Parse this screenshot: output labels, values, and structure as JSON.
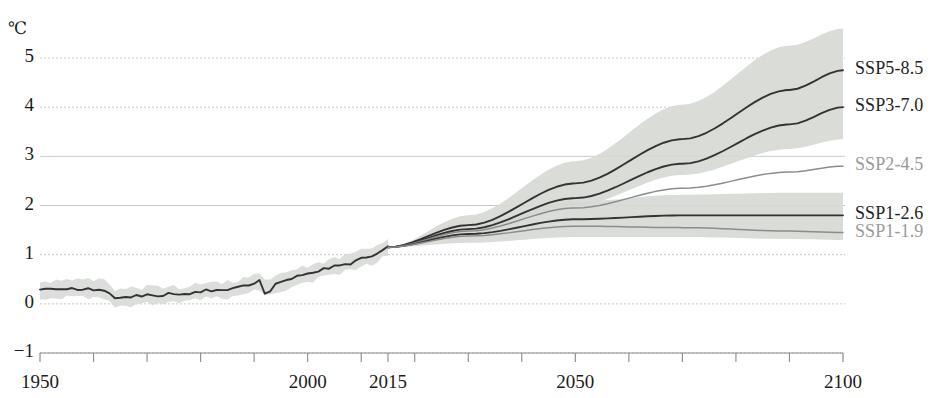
{
  "axes": {
    "unit_label": "℃",
    "y_ticks": [
      "5",
      "4",
      "3",
      "2",
      "1",
      "0",
      "−1"
    ],
    "y_tick_values": [
      5,
      4,
      3,
      2,
      1,
      0,
      -1
    ],
    "x_ticks": [
      "1950",
      "2000",
      "2015",
      "2050",
      "2100"
    ],
    "x_tick_values": [
      1950,
      2000,
      2015,
      2050,
      2100
    ],
    "x_minor_step": 10,
    "grid": "horizontal-dotted"
  },
  "legend": [
    {
      "label": "SSP5-8.5",
      "tone": "dark"
    },
    {
      "label": "SSP3-7.0",
      "tone": "dark"
    },
    {
      "label": "SSP2-4.5",
      "tone": "mid"
    },
    {
      "label": "SSP1-2.6",
      "tone": "dark"
    },
    {
      "label": "SSP1-1.9",
      "tone": "mid"
    }
  ],
  "colors": {
    "line_dark": "#333333",
    "line_mid": "#8c8c8c",
    "band_fill": "#d5d8d3",
    "grid": "#c9c9c9",
    "axis": "#8a8a8a",
    "text": "#1c1c1c"
  },
  "chart_data": {
    "type": "line",
    "title": "",
    "subtitle": "",
    "xlabel": "",
    "ylabel": "℃",
    "xlim": [
      1950,
      2100
    ],
    "ylim": [
      -1,
      5
    ],
    "grid": true,
    "legend_position": "right-inline",
    "series": [
      {
        "name": "historical",
        "label": "Historical observations",
        "tone": "dark",
        "has_band": true,
        "x": [
          1950,
          1952,
          1954,
          1956,
          1958,
          1960,
          1962,
          1964,
          1966,
          1968,
          1970,
          1972,
          1974,
          1976,
          1978,
          1980,
          1982,
          1984,
          1986,
          1988,
          1990,
          1991,
          1992,
          1994,
          1996,
          1998,
          2000,
          2002,
          2004,
          2006,
          2008,
          2010,
          2012,
          2014,
          2015
        ],
        "values": [
          0.3,
          0.29,
          0.3,
          0.3,
          0.3,
          0.3,
          0.29,
          0.1,
          0.12,
          0.16,
          0.18,
          0.17,
          0.2,
          0.18,
          0.22,
          0.25,
          0.28,
          0.26,
          0.3,
          0.36,
          0.42,
          0.46,
          0.3,
          0.4,
          0.47,
          0.55,
          0.6,
          0.68,
          0.72,
          0.8,
          0.82,
          0.92,
          0.98,
          1.08,
          1.15
        ],
        "band_low": [
          0.12,
          0.11,
          0.12,
          0.12,
          0.12,
          0.12,
          0.11,
          -0.06,
          -0.04,
          0.0,
          0.02,
          0.01,
          0.04,
          0.02,
          0.06,
          0.09,
          0.12,
          0.1,
          0.14,
          0.2,
          0.26,
          0.3,
          0.14,
          0.24,
          0.31,
          0.39,
          0.44,
          0.52,
          0.56,
          0.64,
          0.66,
          0.76,
          0.82,
          0.92,
          0.99
        ],
        "band_high": [
          0.48,
          0.47,
          0.48,
          0.48,
          0.48,
          0.48,
          0.47,
          0.26,
          0.28,
          0.32,
          0.34,
          0.33,
          0.36,
          0.34,
          0.38,
          0.41,
          0.44,
          0.42,
          0.46,
          0.52,
          0.58,
          0.62,
          0.46,
          0.56,
          0.63,
          0.71,
          0.76,
          0.84,
          0.88,
          0.96,
          0.98,
          1.08,
          1.14,
          1.24,
          1.31
        ]
      },
      {
        "name": "ssp5-8.5",
        "label": "SSP5-8.5",
        "tone": "dark",
        "has_band": true,
        "x": [
          2015,
          2030,
          2050,
          2070,
          2090,
          2100
        ],
        "values": [
          1.15,
          1.6,
          2.45,
          3.35,
          4.35,
          4.75
        ],
        "band_low": [
          1.15,
          1.42,
          2.0,
          2.62,
          3.15,
          3.35
        ],
        "band_high": [
          1.15,
          1.8,
          2.9,
          4.05,
          5.25,
          5.6
        ]
      },
      {
        "name": "ssp3-7.0",
        "label": "SSP3-7.0",
        "tone": "dark",
        "has_band": false,
        "x": [
          2015,
          2030,
          2050,
          2070,
          2090,
          2100
        ],
        "values": [
          1.15,
          1.52,
          2.15,
          2.85,
          3.65,
          4.0
        ]
      },
      {
        "name": "ssp2-4.5",
        "label": "SSP2-4.5",
        "tone": "mid",
        "has_band": false,
        "x": [
          2015,
          2030,
          2050,
          2070,
          2090,
          2100
        ],
        "values": [
          1.15,
          1.48,
          1.95,
          2.35,
          2.68,
          2.8
        ]
      },
      {
        "name": "ssp1-2.6",
        "label": "SSP1-2.6",
        "tone": "dark",
        "has_band": true,
        "x": [
          2015,
          2030,
          2050,
          2070,
          2090,
          2100
        ],
        "values": [
          1.15,
          1.42,
          1.72,
          1.8,
          1.8,
          1.8
        ],
        "band_low": [
          1.15,
          1.24,
          1.36,
          1.36,
          1.32,
          1.3
        ],
        "band_high": [
          1.15,
          1.62,
          2.08,
          2.22,
          2.26,
          2.26
        ]
      },
      {
        "name": "ssp1-1.9",
        "label": "SSP1-1.9",
        "tone": "mid",
        "has_band": false,
        "x": [
          2015,
          2030,
          2050,
          2070,
          2090,
          2100
        ],
        "values": [
          1.15,
          1.38,
          1.58,
          1.55,
          1.48,
          1.45
        ]
      }
    ]
  }
}
